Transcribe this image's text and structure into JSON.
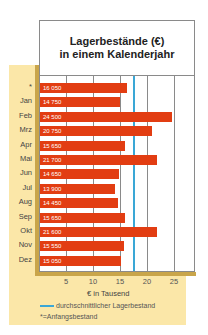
{
  "chart_data": {
    "type": "bar",
    "orientation": "horizontal",
    "title": "Lagerbestände (€) in einem Kalenderjahr",
    "title_lines": [
      "Lagerbestände (€)",
      "in einem Kalenderjahr"
    ],
    "categories": [
      "*",
      "Jan",
      "Feb",
      "Mrz",
      "Apr",
      "Mai",
      "Jun",
      "Jul",
      "Aug",
      "Sep",
      "Okt",
      "Nov",
      "Dez"
    ],
    "values": [
      16050,
      14750,
      24500,
      20750,
      15650,
      21700,
      14650,
      13900,
      14450,
      15650,
      21600,
      15550,
      15050
    ],
    "value_labels": [
      "16 050",
      "14 750",
      "24 500",
      "20 750",
      "15 650",
      "21 700",
      "14 650",
      "13 900",
      "14 450",
      "15 650",
      "21 600",
      "15 550",
      "15 050"
    ],
    "xlabel": "€ in Tausend",
    "ylabel": "",
    "xticks": [
      "5",
      "10",
      "15",
      "20",
      "25"
    ],
    "xlim": [
      0,
      28.5
    ],
    "average_line": {
      "label": "durchschnittlicher Lagerbestand",
      "value": 17.4,
      "color": "#3aa7d6"
    },
    "footnote": "* = Anfangsbestand",
    "grid": true,
    "legend_position": "bottom",
    "bar_color": "#e23d12"
  },
  "legend": {
    "average": "durchschnittlicher Lagerbestand",
    "footnote": "*=Anfangsbestand"
  }
}
